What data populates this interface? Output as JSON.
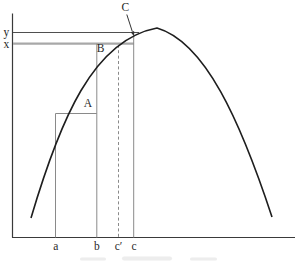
{
  "figure": {
    "colors": {
      "background": "#ffffff",
      "ink": "#2a2a2a",
      "curve": "#1e1e1e",
      "guide": "#8a8a8a",
      "y_value_line": "#4f4f4f",
      "x_value_line": "#a8a8a8"
    },
    "curve_path": "M 31 218 C 60 120 93 40 157 28 C 205 42 240 120 272 217",
    "point_labels": {
      "A": "A",
      "B": "B",
      "C": "C"
    },
    "y_axis_labels": {
      "y": "y",
      "x": "x"
    },
    "x_axis_labels": {
      "a": "a",
      "b": "b",
      "c_prime": "c′",
      "c": "c"
    }
  }
}
